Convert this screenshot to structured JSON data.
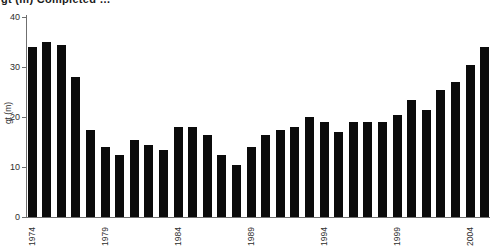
{
  "title": {
    "text": "gt (m) Completed …",
    "clipped_at_top": true
  },
  "chart_data": {
    "type": "bar",
    "title": "gt (m) Completed …",
    "xlabel": "",
    "ylabel": "gt (m)",
    "ylim": [
      0,
      40
    ],
    "yticks": [
      0,
      10,
      20,
      30,
      40
    ],
    "ytick_labels": [
      "0",
      "10",
      "20",
      "30",
      "40"
    ],
    "xtick_labels": [
      "1974",
      "1979",
      "1984",
      "1989",
      "1994",
      "1999",
      "2004"
    ],
    "xtick_interval_years": 5,
    "categories": [
      1974,
      1975,
      1976,
      1977,
      1978,
      1979,
      1980,
      1981,
      1982,
      1983,
      1984,
      1985,
      1986,
      1987,
      1988,
      1989,
      1990,
      1991,
      1992,
      1993,
      1994,
      1995,
      1996,
      1997,
      1998,
      1999,
      2000,
      2001,
      2002,
      2003,
      2004,
      2005
    ],
    "values": [
      34,
      35,
      34.5,
      28,
      17.5,
      14,
      12.5,
      15.5,
      14.5,
      13.5,
      18,
      18,
      16.5,
      12.5,
      10.5,
      14,
      16.5,
      17.5,
      18,
      20,
      19,
      17,
      19,
      19,
      19,
      20.5,
      23.5,
      21.5,
      25.5,
      27,
      30.5,
      34
    ],
    "grid": false,
    "legend": null,
    "bar_color": "#0b0b0b",
    "axis_color": "#6f6f6f",
    "text_color": "#2e2e2e",
    "background_color": "#ffffff"
  }
}
